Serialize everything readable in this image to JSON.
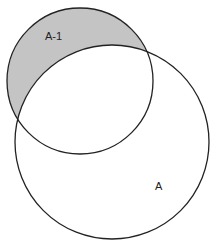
{
  "diagram": {
    "type": "venn",
    "shaded_color": "#c4c4c4",
    "stroke_color": "#222222",
    "circles": [
      {
        "id": "small",
        "cx": 80,
        "cy": 81,
        "r": 73
      },
      {
        "id": "large",
        "cx": 112,
        "cy": 142,
        "r": 97
      }
    ],
    "labels": {
      "shaded_region": "A-1",
      "large_circle": "A"
    }
  }
}
